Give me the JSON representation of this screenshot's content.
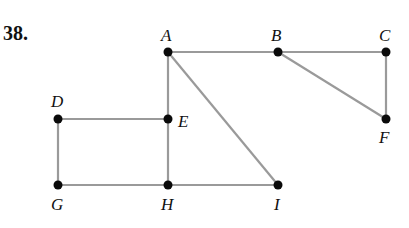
{
  "problem": {
    "number": "38."
  },
  "colors": {
    "edge": "#9a9a9a",
    "node": "#0a0a0a",
    "label": "#111111"
  },
  "graph": {
    "nodes": [
      {
        "id": "A",
        "label": "A",
        "x": 168,
        "y": 52,
        "lx": 161,
        "ly": 41
      },
      {
        "id": "B",
        "label": "B",
        "x": 278,
        "y": 52,
        "lx": 271,
        "ly": 41
      },
      {
        "id": "C",
        "label": "C",
        "x": 386,
        "y": 52,
        "lx": 379,
        "ly": 41
      },
      {
        "id": "D",
        "label": "D",
        "x": 58,
        "y": 119,
        "lx": 51,
        "ly": 107
      },
      {
        "id": "E",
        "label": "E",
        "x": 168,
        "y": 119,
        "lx": 178,
        "ly": 127
      },
      {
        "id": "F",
        "label": "F",
        "x": 386,
        "y": 119,
        "lx": 379,
        "ly": 143
      },
      {
        "id": "G",
        "label": "G",
        "x": 58,
        "y": 185,
        "lx": 51,
        "ly": 210
      },
      {
        "id": "H",
        "label": "H",
        "x": 168,
        "y": 185,
        "lx": 161,
        "ly": 210
      },
      {
        "id": "I",
        "label": "I",
        "x": 278,
        "y": 185,
        "lx": 274,
        "ly": 210
      }
    ],
    "edges": [
      [
        "A",
        "B"
      ],
      [
        "B",
        "C"
      ],
      [
        "C",
        "F"
      ],
      [
        "B",
        "F"
      ],
      [
        "A",
        "E"
      ],
      [
        "E",
        "H"
      ],
      [
        "A",
        "I"
      ],
      [
        "D",
        "E"
      ],
      [
        "D",
        "G"
      ],
      [
        "G",
        "H"
      ],
      [
        "H",
        "I"
      ]
    ]
  }
}
